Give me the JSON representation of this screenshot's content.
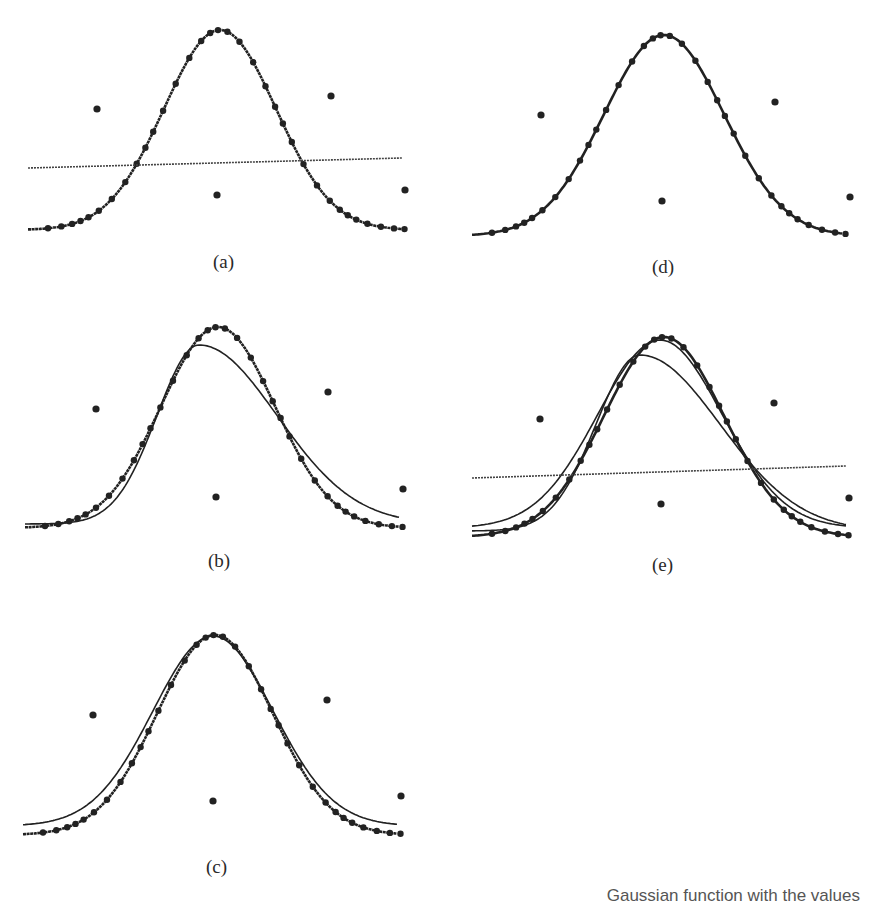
{
  "figure": {
    "ink_color": "#222222",
    "background": "#ffffff",
    "caption_fragment": "Gaussian function with the values"
  },
  "chart_data": [
    {
      "type": "line",
      "panel": "(a)",
      "title": "",
      "xlabel": "(a)",
      "grid": false,
      "series": [
        {
          "name": "gaussian-fit",
          "kind": "gaussian",
          "x_start": 28,
          "x_end": 402,
          "center": 220,
          "peak_y": 30,
          "base_y": 230,
          "sigma": 56,
          "style": "dotted-thick"
        },
        {
          "name": "flat-fit",
          "kind": "line",
          "points": [
            [
              28,
              168
            ],
            [
              402,
              158
            ]
          ],
          "style": "dotted"
        }
      ],
      "outliers": [
        [
          97,
          109
        ],
        [
          217,
          195
        ],
        [
          331,
          96
        ],
        [
          405,
          190
        ]
      ],
      "label_pos": [
        213,
        268
      ]
    },
    {
      "type": "line",
      "panel": "(d)",
      "title": "",
      "xlabel": "(d)",
      "grid": false,
      "series": [
        {
          "name": "gaussian-fit",
          "kind": "gaussian",
          "x_start": 472,
          "x_end": 843,
          "center": 664,
          "peak_y": 35,
          "base_y": 236,
          "sigma": 60,
          "style": "solid-thick"
        }
      ],
      "outliers": [
        [
          541,
          115
        ],
        [
          662,
          201
        ],
        [
          775,
          102
        ],
        [
          850,
          197
        ]
      ],
      "label_pos": [
        652,
        273
      ]
    },
    {
      "type": "line",
      "panel": "(b)",
      "title": "",
      "xlabel": "(b)",
      "grid": false,
      "series": [
        {
          "name": "gaussian-fit",
          "kind": "gaussian",
          "x_start": 25,
          "x_end": 400,
          "center": 218,
          "peak_y": 327,
          "base_y": 528,
          "sigma": 57,
          "style": "dotted-thick"
        },
        {
          "name": "skewed-fit",
          "kind": "skew",
          "x_start": 25,
          "x_end": 400,
          "center": 199,
          "peak_y": 345,
          "base_y": 524,
          "sigma_left": 42,
          "sigma_right": 78,
          "style": "solid"
        }
      ],
      "outliers": [
        [
          96,
          409
        ],
        [
          216,
          497
        ],
        [
          328,
          392
        ],
        [
          403,
          489
        ]
      ],
      "label_pos": [
        208,
        567
      ]
    },
    {
      "type": "line",
      "panel": "(e)",
      "title": "",
      "xlabel": "(e)",
      "grid": false,
      "series": [
        {
          "name": "gaussian-fit",
          "kind": "gaussian",
          "x_start": 472,
          "x_end": 846,
          "center": 664,
          "peak_y": 337,
          "base_y": 537,
          "sigma": 60,
          "style": "solid-thick"
        },
        {
          "name": "gaussian-fit-2",
          "kind": "gaussian",
          "x_start": 472,
          "x_end": 846,
          "center": 660,
          "peak_y": 340,
          "base_y": 528,
          "sigma": 62,
          "style": "solid"
        },
        {
          "name": "skewed-fit",
          "kind": "skew",
          "x_start": 472,
          "x_end": 846,
          "center": 640,
          "peak_y": 355,
          "base_y": 531,
          "sigma_left": 44,
          "sigma_right": 80,
          "style": "solid"
        },
        {
          "name": "flat-fit",
          "kind": "line",
          "points": [
            [
              472,
              478
            ],
            [
              846,
              466
            ]
          ],
          "style": "dotted"
        }
      ],
      "outliers": [
        [
          540,
          419
        ],
        [
          661,
          504
        ],
        [
          774,
          403
        ],
        [
          849,
          498
        ]
      ],
      "label_pos": [
        652,
        571
      ]
    },
    {
      "type": "line",
      "panel": "(c)",
      "title": "",
      "xlabel": "(c)",
      "grid": false,
      "series": [
        {
          "name": "gaussian-fit",
          "kind": "gaussian",
          "x_start": 23,
          "x_end": 398,
          "center": 215,
          "peak_y": 635,
          "base_y": 835,
          "sigma": 58,
          "style": "dotted-thick"
        },
        {
          "name": "gaussian-fit-2",
          "kind": "gaussian",
          "x_start": 23,
          "x_end": 398,
          "center": 213,
          "peak_y": 636,
          "base_y": 826,
          "sigma": 60,
          "style": "solid"
        }
      ],
      "outliers": [
        [
          93,
          715
        ],
        [
          213,
          801
        ],
        [
          327,
          700
        ],
        [
          401,
          796
        ]
      ],
      "label_pos": [
        206,
        873
      ]
    }
  ]
}
